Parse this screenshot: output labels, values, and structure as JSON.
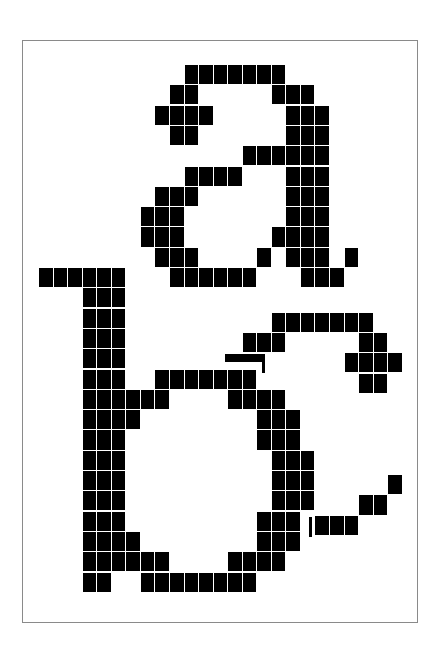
{
  "colors": {
    "background": "#ffffff",
    "pixel": "#000000",
    "frame": "#8a8a8a"
  },
  "grid": {
    "origin_x": 39,
    "origin_y": 65,
    "col_pitch": 14.55,
    "row_pitch": 20.3,
    "cell_w": 13.6,
    "cell_h": 19.2
  },
  "glyphs": [
    {
      "name": "glyph-a-and-b",
      "row_offset": 0,
      "rows": [
        [
          [
            10,
            16
          ]
        ],
        [
          [
            9,
            10
          ],
          [
            16,
            18
          ]
        ],
        [
          [
            8,
            11
          ],
          [
            17,
            19
          ]
        ],
        [
          [
            9,
            10
          ],
          [
            17,
            19
          ]
        ],
        [
          [
            14,
            19
          ]
        ],
        [
          [
            10,
            13
          ],
          [
            17,
            19
          ]
        ],
        [
          [
            8,
            10
          ],
          [
            17,
            19
          ]
        ],
        [
          [
            7,
            9
          ],
          [
            17,
            19
          ]
        ],
        [
          [
            7,
            9
          ],
          [
            16,
            19
          ]
        ],
        [
          [
            8,
            10
          ],
          [
            15,
            15
          ],
          [
            17,
            19
          ],
          [
            21,
            21
          ]
        ],
        [
          [
            0,
            5
          ],
          [
            9,
            14
          ],
          [
            18,
            20
          ]
        ],
        [
          [
            3,
            5
          ]
        ],
        [
          [
            3,
            5
          ]
        ],
        [
          [
            3,
            5
          ]
        ],
        [
          [
            3,
            5
          ]
        ],
        [
          [
            3,
            5
          ],
          [
            8,
            14
          ]
        ],
        [
          [
            3,
            8
          ],
          [
            13,
            16
          ]
        ],
        [
          [
            3,
            6
          ],
          [
            15,
            17
          ]
        ],
        [
          [
            3,
            5
          ],
          [
            15,
            17
          ]
        ],
        [
          [
            3,
            5
          ],
          [
            16,
            18
          ]
        ],
        [
          [
            3,
            5
          ],
          [
            16,
            18
          ]
        ],
        [
          [
            3,
            5
          ],
          [
            16,
            18
          ]
        ],
        [
          [
            3,
            5
          ],
          [
            15,
            17
          ]
        ],
        [
          [
            3,
            6
          ],
          [
            15,
            17
          ]
        ],
        [
          [
            3,
            8
          ],
          [
            13,
            16
          ]
        ],
        [
          [
            3,
            4
          ],
          [
            7,
            14
          ]
        ]
      ]
    },
    {
      "name": "glyph-c",
      "row_offset": 12.2,
      "rows": [
        [
          [
            16,
            22
          ]
        ],
        [
          [
            14,
            16
          ],
          [
            22,
            23
          ]
        ],
        [
          [
            21,
            24
          ]
        ],
        [
          [
            22,
            23
          ]
        ],
        [],
        [],
        [],
        [],
        [
          [
            24,
            24
          ]
        ],
        [
          [
            22,
            23
          ]
        ],
        [
          [
            19,
            21
          ]
        ]
      ],
      "partials": [
        {
          "x": 225,
          "y": 354,
          "w": 40,
          "h": 8
        },
        {
          "x": 262,
          "y": 354,
          "w": 3,
          "h": 19
        },
        {
          "x": 309,
          "y": 517,
          "w": 3,
          "h": 20
        }
      ]
    }
  ]
}
